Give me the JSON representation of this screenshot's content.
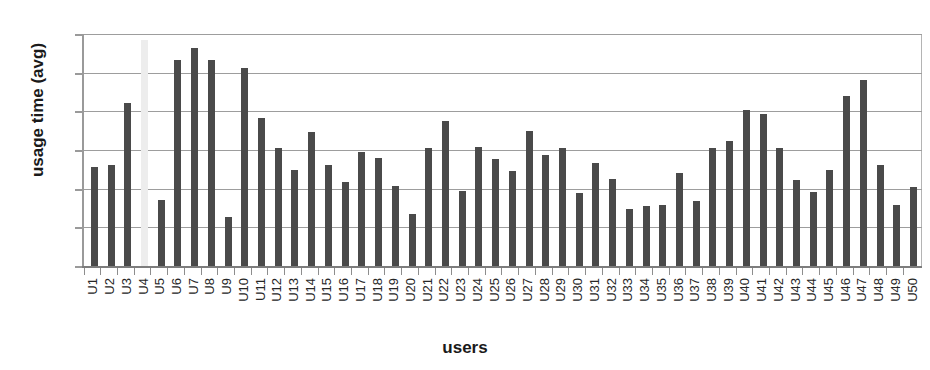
{
  "chart_data": {
    "type": "bar",
    "title": "",
    "xlabel": "users",
    "ylabel": "usage time (avg)",
    "ylim": [
      0,
      6
    ],
    "yticks": [
      0,
      1,
      2,
      3,
      4,
      5,
      6
    ],
    "ytick_labels": [
      "0",
      "1",
      "2",
      "3",
      "4",
      "5",
      "6"
    ],
    "grid": "horizontal",
    "legend": "none",
    "bar_color": "#4a4a4a",
    "highlight_color": "#ededed",
    "highlight_categories": [
      "U4"
    ],
    "categories": [
      "U1",
      "U2",
      "U3",
      "U4",
      "U5",
      "U6",
      "U7",
      "U8",
      "U9",
      "U10",
      "U11",
      "U12",
      "U13",
      "U14",
      "U15",
      "U16",
      "U17",
      "U18",
      "U19",
      "U20",
      "U21",
      "U22",
      "U23",
      "U24",
      "U25",
      "U26",
      "U27",
      "U28",
      "U29",
      "U30",
      "U31",
      "U32",
      "U33",
      "U34",
      "U35",
      "U36",
      "U37",
      "U38",
      "U39",
      "U40",
      "U41",
      "U42",
      "U43",
      "U44",
      "U45",
      "U46",
      "U47",
      "U48",
      "U49",
      "U50"
    ],
    "values": [
      2.55,
      2.62,
      4.22,
      5.85,
      1.7,
      5.32,
      5.65,
      5.32,
      1.26,
      5.12,
      3.82,
      3.04,
      2.48,
      3.46,
      2.62,
      2.18,
      2.94,
      2.8,
      2.06,
      1.35,
      3.04,
      3.76,
      1.94,
      3.08,
      2.78,
      2.46,
      3.5,
      2.88,
      3.04,
      1.9,
      2.66,
      2.26,
      1.48,
      1.54,
      1.58,
      2.4,
      1.68,
      3.04,
      3.24,
      4.04,
      3.92,
      3.06,
      2.22,
      1.92,
      2.48,
      4.4,
      4.82,
      2.6,
      1.58,
      2.05
    ]
  }
}
